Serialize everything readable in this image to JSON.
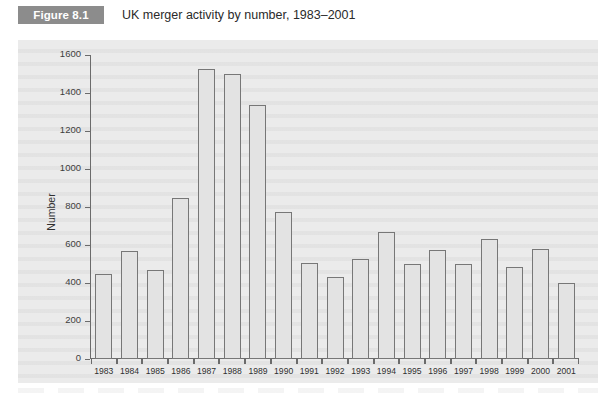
{
  "figure": {
    "badge_label": "Figure 8.1",
    "title": "UK merger activity by number, 1983–2001"
  },
  "chart_data": {
    "type": "bar",
    "title": "UK merger activity by number, 1983–2001",
    "xlabel": "",
    "ylabel": "Number",
    "ylim": [
      0,
      1600
    ],
    "ytick_step": 200,
    "yticks": [
      0,
      200,
      400,
      600,
      800,
      1000,
      1200,
      1400,
      1600
    ],
    "ytick_labels": [
      "0",
      "200",
      "400",
      "600",
      "800",
      "1000",
      "1200",
      "1400",
      "1600"
    ],
    "grid": false,
    "legend": null,
    "bar_face_color": "#e3e3e3",
    "bar_edge_color": "#777777",
    "panel_color": "#ebebeb",
    "categories": [
      "1983",
      "1984",
      "1985",
      "1986",
      "1987",
      "1988",
      "1989",
      "1990",
      "1991",
      "1992",
      "1993",
      "1994",
      "1995",
      "1996",
      "1997",
      "1998",
      "1999",
      "2000",
      "2001"
    ],
    "values": [
      445,
      570,
      470,
      845,
      1525,
      1500,
      1335,
      775,
      505,
      430,
      525,
      670,
      500,
      575,
      500,
      630,
      485,
      580,
      400
    ]
  }
}
